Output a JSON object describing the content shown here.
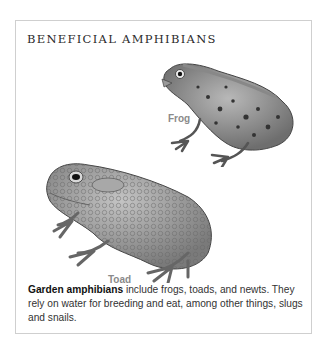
{
  "panel": {
    "title": "BENEFICIAL AMPHIBIANS",
    "illustrations": [
      {
        "name": "frog",
        "label": "Frog"
      },
      {
        "name": "toad",
        "label": "Toad"
      }
    ],
    "caption": {
      "bold": "Garden amphibians",
      "text": " include frogs, toads, and newts. They rely on water for breeding and eat, among other things, slugs and snails."
    }
  }
}
